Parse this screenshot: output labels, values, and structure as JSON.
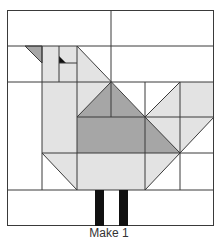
{
  "caption": "Make 1",
  "colors": {
    "outline": "#3a3a3a",
    "background": "#ffffff",
    "light_fabric": "#e3e3e3",
    "medium_fabric": "#a6a6a6",
    "dark_fabric": "#111111"
  },
  "block": {
    "description": "Quilt block diagram of a bird (chicken) made of squares and half-square triangles",
    "pieces": [
      {
        "name": "top-left-background",
        "shade": "white"
      },
      {
        "name": "top-right-background",
        "shade": "white"
      },
      {
        "name": "beak",
        "shade": "medium"
      },
      {
        "name": "head",
        "shade": "light"
      },
      {
        "name": "eye",
        "shade": "dark"
      },
      {
        "name": "neck",
        "shade": "light"
      },
      {
        "name": "body",
        "shade": "light"
      },
      {
        "name": "wing",
        "shade": "medium"
      },
      {
        "name": "tail",
        "shade": "light"
      },
      {
        "name": "legs",
        "shade": "dark"
      },
      {
        "name": "bottom-background",
        "shade": "white"
      }
    ]
  }
}
